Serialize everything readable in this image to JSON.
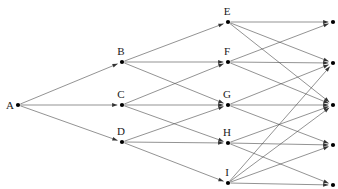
{
  "diagram": {
    "type": "directed-acyclic-graph",
    "width": 338,
    "height": 189,
    "background_color": "#ffffff",
    "edge_color": "#4a4a4a",
    "node_color": "#000000",
    "label_color": "#1a1a1a",
    "layers": [
      {
        "name": "layer-1-source",
        "x": 18,
        "node_ids": [
          "A"
        ]
      },
      {
        "name": "layer-2",
        "x": 122,
        "node_ids": [
          "B",
          "C",
          "D"
        ]
      },
      {
        "name": "layer-3",
        "x": 228,
        "node_ids": [
          "E",
          "F",
          "G",
          "H",
          "I"
        ]
      },
      {
        "name": "layer-4-sinks",
        "x": 333,
        "node_ids": [
          "T1",
          "T2",
          "T3",
          "T4",
          "T5"
        ]
      }
    ],
    "nodes": [
      {
        "id": "A",
        "label": "A",
        "x": 18,
        "y": 105,
        "label_dx": -8,
        "label_dy": 4,
        "show_label": true
      },
      {
        "id": "B",
        "label": "B",
        "x": 122,
        "y": 62,
        "label_dx": -1,
        "label_dy": -7,
        "show_label": true
      },
      {
        "id": "C",
        "label": "C",
        "x": 122,
        "y": 105,
        "label_dx": -1,
        "label_dy": -7,
        "show_label": true
      },
      {
        "id": "D",
        "label": "D",
        "x": 122,
        "y": 142,
        "label_dx": -1,
        "label_dy": -7,
        "show_label": true
      },
      {
        "id": "E",
        "label": "E",
        "x": 228,
        "y": 22,
        "label_dx": -1,
        "label_dy": -7,
        "show_label": true
      },
      {
        "id": "F",
        "label": "F",
        "x": 228,
        "y": 62,
        "label_dx": -1,
        "label_dy": -7,
        "show_label": true
      },
      {
        "id": "G",
        "label": "G",
        "x": 228,
        "y": 105,
        "label_dx": -1,
        "label_dy": -7,
        "show_label": true
      },
      {
        "id": "H",
        "label": "H",
        "x": 228,
        "y": 143,
        "label_dx": -1,
        "label_dy": -7,
        "show_label": true
      },
      {
        "id": "I",
        "label": "I",
        "x": 228,
        "y": 183,
        "label_dx": -1,
        "label_dy": -7,
        "show_label": true
      },
      {
        "id": "T1",
        "label": "",
        "x": 333,
        "y": 22,
        "label_dx": 0,
        "label_dy": 0,
        "show_label": false
      },
      {
        "id": "T2",
        "label": "",
        "x": 333,
        "y": 63,
        "label_dx": 0,
        "label_dy": 0,
        "show_label": false
      },
      {
        "id": "T3",
        "label": "",
        "x": 333,
        "y": 105,
        "label_dx": 0,
        "label_dy": 0,
        "show_label": false
      },
      {
        "id": "T4",
        "label": "",
        "x": 333,
        "y": 145,
        "label_dx": 0,
        "label_dy": 0,
        "show_label": false
      },
      {
        "id": "T5",
        "label": "",
        "x": 333,
        "y": 185,
        "label_dx": 0,
        "label_dy": 0,
        "show_label": false
      }
    ],
    "edges": [
      {
        "from": "A",
        "to": "B"
      },
      {
        "from": "A",
        "to": "C"
      },
      {
        "from": "A",
        "to": "D"
      },
      {
        "from": "B",
        "to": "E"
      },
      {
        "from": "B",
        "to": "F"
      },
      {
        "from": "B",
        "to": "G"
      },
      {
        "from": "C",
        "to": "F"
      },
      {
        "from": "C",
        "to": "G"
      },
      {
        "from": "C",
        "to": "H"
      },
      {
        "from": "D",
        "to": "G"
      },
      {
        "from": "D",
        "to": "H"
      },
      {
        "from": "D",
        "to": "I"
      },
      {
        "from": "E",
        "to": "T1"
      },
      {
        "from": "E",
        "to": "T2"
      },
      {
        "from": "E",
        "to": "T3"
      },
      {
        "from": "F",
        "to": "T1"
      },
      {
        "from": "F",
        "to": "T2"
      },
      {
        "from": "F",
        "to": "T3"
      },
      {
        "from": "G",
        "to": "T2"
      },
      {
        "from": "G",
        "to": "T3"
      },
      {
        "from": "G",
        "to": "T4"
      },
      {
        "from": "H",
        "to": "T3"
      },
      {
        "from": "H",
        "to": "T4"
      },
      {
        "from": "H",
        "to": "T5"
      },
      {
        "from": "I",
        "to": "T2"
      },
      {
        "from": "I",
        "to": "T3"
      },
      {
        "from": "I",
        "to": "T4"
      },
      {
        "from": "I",
        "to": "T5"
      }
    ],
    "node_radius": 2.1,
    "arrow_length": 5.2,
    "arrow_half_width": 1.9,
    "arrow_gap": 2.6
  }
}
